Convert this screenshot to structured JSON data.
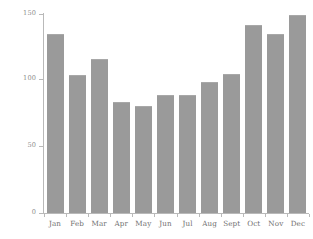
{
  "chart_data": {
    "type": "bar",
    "title": "",
    "subtitle": "",
    "xlabel": "",
    "ylabel": "Average rainfall (mm)",
    "categories": [
      "Jan",
      "Feb",
      "Mar",
      "Apr",
      "May",
      "Jun",
      "Jul",
      "Aug",
      "Sept",
      "Oct",
      "Nov",
      "Dec"
    ],
    "values": [
      135,
      104,
      116,
      84,
      81,
      89,
      89,
      99,
      105,
      142,
      135,
      149
    ],
    "ylim": [
      0,
      150
    ],
    "yticks": [
      0,
      50,
      100,
      150
    ],
    "ytick_labels": [
      "0",
      "50",
      "100",
      "150"
    ],
    "grid": false,
    "legend": false,
    "bar_color": "#9a9a9a",
    "axis_color": "#b9b9b9",
    "text_color": "#7a7a7a",
    "background": "#ffffff"
  }
}
